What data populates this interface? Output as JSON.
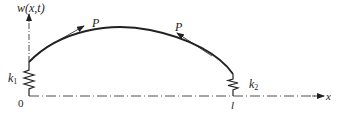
{
  "diagram": {
    "type": "beam-on-springs",
    "labels": {
      "y_axis": "w(x,t)",
      "x_axis": "x",
      "origin": "0",
      "length": "l",
      "force_left": "P",
      "force_right": "P",
      "spring_left": "k",
      "spring_left_sub": "1",
      "spring_right": "k",
      "spring_right_sub": "2"
    },
    "colors": {
      "stroke": "#222222",
      "background": "#ffffff"
    }
  }
}
